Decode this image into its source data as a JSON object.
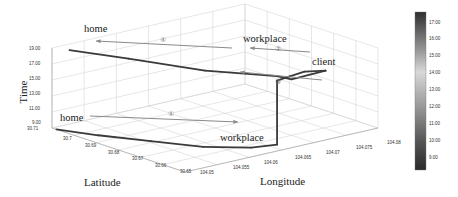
{
  "chart_data": {
    "type": "line",
    "subtype": "3d-trajectory",
    "title": "",
    "xlabel": "Latitude",
    "ylabel": "Longitude",
    "zlabel": "Time",
    "x_ticks": [
      "30.71",
      "30.7",
      "30.69",
      "30.68",
      "30.67",
      "30.66",
      "30.65"
    ],
    "y_ticks": [
      "104.05",
      "104.055",
      "104.06",
      "104.065",
      "104.07",
      "104.075",
      "104.08"
    ],
    "z_ticks": [
      "9.00",
      "11.00",
      "13.00",
      "15.00",
      "17.00",
      "19.00"
    ],
    "xlim": [
      30.65,
      30.71
    ],
    "ylim": [
      104.05,
      104.08
    ],
    "zlim": [
      9.0,
      19.0
    ],
    "grid": true,
    "colorbar": {
      "ticks": [
        "17:00",
        "16:00",
        "15:00",
        "14:00",
        "13:00",
        "12:00",
        "11:00",
        "10:00",
        "9:00"
      ],
      "range": [
        8.5,
        17.5
      ],
      "colormap": "grayscale"
    },
    "annotations": [
      {
        "label": "home",
        "note": "start of trip 1, low time"
      },
      {
        "label": "workplace",
        "note": "end of trip 1, bottom"
      },
      {
        "label": "workplace",
        "note": "start of trip 2, top"
      },
      {
        "label": "client",
        "note": "end of trip 2"
      },
      {
        "label": "home",
        "note": "end of trip 4, top-left"
      }
    ],
    "trip_markers": [
      "①",
      "②",
      "③",
      "④"
    ],
    "series": [
      {
        "name": "trajectory",
        "points": [
          {
            "lat": 30.708,
            "lon": 104.05,
            "time": 9.0
          },
          {
            "lat": 30.695,
            "lon": 104.052,
            "time": 9.1
          },
          {
            "lat": 30.68,
            "lon": 104.055,
            "time": 9.2
          },
          {
            "lat": 30.665,
            "lon": 104.058,
            "time": 9.3
          },
          {
            "lat": 30.655,
            "lon": 104.062,
            "time": 9.4
          },
          {
            "lat": 30.652,
            "lon": 104.065,
            "time": 9.5
          },
          {
            "lat": 30.652,
            "lon": 104.065,
            "time": 17.5
          },
          {
            "lat": 30.655,
            "lon": 104.068,
            "time": 17.2
          },
          {
            "lat": 30.66,
            "lon": 104.072,
            "time": 16.6
          },
          {
            "lat": 30.662,
            "lon": 104.076,
            "time": 15.8
          },
          {
            "lat": 30.66,
            "lon": 104.07,
            "time": 16.0
          },
          {
            "lat": 30.655,
            "lon": 104.066,
            "time": 17.6
          },
          {
            "lat": 30.67,
            "lon": 104.06,
            "time": 18.0
          },
          {
            "lat": 30.69,
            "lon": 104.055,
            "time": 18.6
          },
          {
            "lat": 30.705,
            "lon": 104.051,
            "time": 19.0
          }
        ]
      }
    ]
  }
}
